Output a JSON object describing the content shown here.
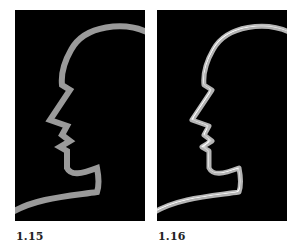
{
  "figures": [
    {
      "label": "1.15",
      "style": "flat",
      "stroke_color": "#9a9a9a",
      "background": "#000000"
    },
    {
      "label": "1.16",
      "style": "embossed",
      "stroke_color": "#c8c8c8",
      "highlight_color": "#f0f0f0",
      "background": "#000000"
    }
  ]
}
